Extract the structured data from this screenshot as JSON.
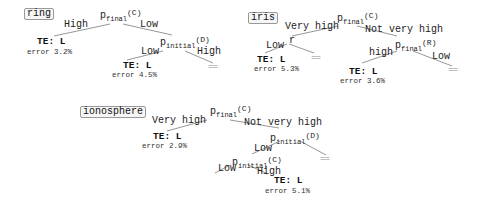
{
  "trees": [
    {
      "title": "ring",
      "root": {
        "var": "p",
        "sub": "final",
        "type": "(C)"
      },
      "edges": {
        "root_left": "High",
        "root_right": "Low",
        "n1_left": "Low",
        "n1_right": "High"
      },
      "n1": {
        "var": "p",
        "sub": "initial",
        "type": "(D)"
      },
      "leaves": [
        {
          "te": "TE: L",
          "error": "error 3.2%"
        },
        {
          "te": "TE: L",
          "error": "error 4.5%"
        }
      ],
      "stubs": [
        "=="
      ]
    },
    {
      "title": "iris",
      "root": {
        "var": "p",
        "sub": "final",
        "type": "(C)"
      },
      "edges": {
        "root_left": "Very high",
        "root_right": "Not very high",
        "n1_left": "Low",
        "n2_left": "high",
        "n2_right": "Low"
      },
      "n1": {
        "var": "r"
      },
      "n2": {
        "var": "p",
        "sub": "final",
        "type": "(R)"
      },
      "leaves": [
        {
          "te": "TE: L",
          "error": "error 5.3%"
        },
        {
          "te": "TE: L",
          "error": "error 3.6%"
        }
      ],
      "stubs": [
        "==",
        "=="
      ]
    },
    {
      "title": "ionosphere",
      "root": {
        "var": "p",
        "sub": "final",
        "type": "(C)"
      },
      "edges": {
        "root_left": "Very high",
        "root_right": "Not very high",
        "n1_left": "Low",
        "n2_left": "Low",
        "n2_right": "High"
      },
      "n1": {
        "var": "p",
        "sub": "initial",
        "type": "(D)"
      },
      "n2": {
        "var": "p",
        "sub": "initial",
        "type": "(C)"
      },
      "leaves": [
        {
          "te": "TE: L",
          "error": "error 2.9%"
        },
        {
          "te": "TE: L",
          "error": "error 5.1%"
        }
      ],
      "stubs": [
        "=="
      ]
    }
  ]
}
